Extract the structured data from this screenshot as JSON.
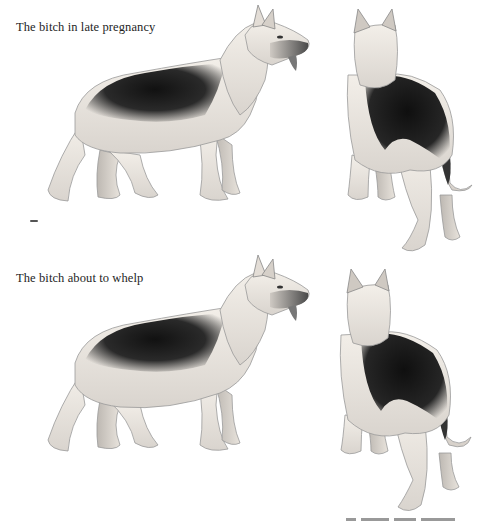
{
  "figures": [
    {
      "id": "late-pregnancy",
      "caption": "The bitch in late pregnancy",
      "views": [
        "side-view",
        "rear-three-quarter-view"
      ]
    },
    {
      "id": "about-to-whelp",
      "caption": "The bitch about to whelp",
      "views": [
        "side-view",
        "rear-three-quarter-view"
      ]
    }
  ],
  "colors": {
    "background": "#ffffff",
    "saddle_dark": "#1a1a1a",
    "coat_light": "#efe9e2",
    "outline": "#8a8a8a",
    "caption_text": "#1e1e1e"
  }
}
